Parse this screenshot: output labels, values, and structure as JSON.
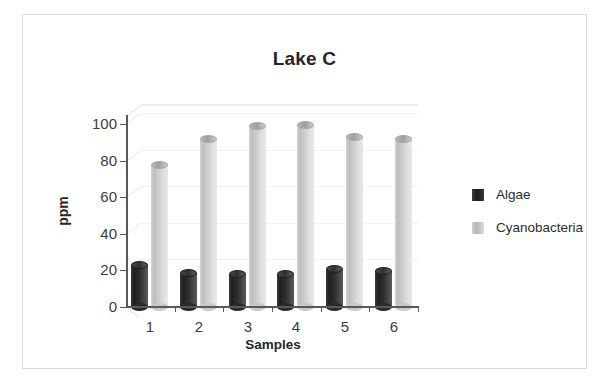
{
  "chart_data": {
    "type": "bar",
    "title": "Lake C",
    "xlabel": "Samples",
    "ylabel": "ppm",
    "categories": [
      "1",
      "2",
      "3",
      "4",
      "5",
      "6"
    ],
    "series": [
      {
        "name": "Algae",
        "color": "#2b2b2b",
        "values": [
          25,
          21,
          20,
          20,
          23,
          22
        ]
      },
      {
        "name": "Cyanobacteria",
        "color": "#c8c8c8",
        "values": [
          80,
          94,
          101,
          102,
          95,
          94
        ]
      }
    ],
    "yticks": [
      0,
      20,
      40,
      60,
      80,
      100
    ],
    "ylim": [
      0,
      100
    ],
    "grid": true,
    "legend_position": "right",
    "style": "3d-cylinder"
  }
}
